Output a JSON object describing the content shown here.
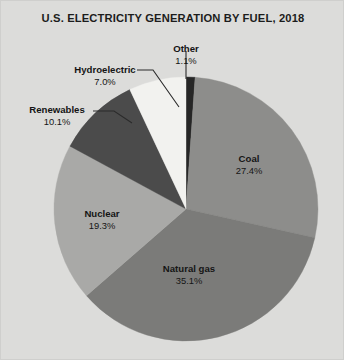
{
  "chart_data": {
    "type": "pie",
    "title": "U.S. ELECTRICITY GENERATION BY FUEL, 2018",
    "subtitle": "",
    "xlabel": "",
    "ylabel": "",
    "units": "percent",
    "legend_position": "none",
    "grid": false,
    "start_angle_deg": 0,
    "direction": "clockwise",
    "categories": [
      "Other",
      "Coal",
      "Natural gas",
      "Nuclear",
      "Renewables",
      "Hydroelectric"
    ],
    "values": [
      1.1,
      27.4,
      35.1,
      19.3,
      10.1,
      7.0
    ],
    "slices": [
      {
        "name": "Other",
        "value": 1.1,
        "pct_label": "1.1%",
        "color": "#262626",
        "label_placement": "outside",
        "leader_line": true
      },
      {
        "name": "Coal",
        "value": 27.4,
        "pct_label": "27.4%",
        "color": "#8d8d8b",
        "label_placement": "inside",
        "leader_line": false
      },
      {
        "name": "Natural gas",
        "value": 35.1,
        "pct_label": "35.1%",
        "color": "#7b7b79",
        "label_placement": "inside",
        "leader_line": false
      },
      {
        "name": "Nuclear",
        "value": 19.3,
        "pct_label": "19.3%",
        "color": "#a9a9a7",
        "label_placement": "inside",
        "leader_line": false
      },
      {
        "name": "Renewables",
        "value": 10.1,
        "pct_label": "10.1%",
        "color": "#4b4b4b",
        "label_placement": "outside",
        "leader_line": true
      },
      {
        "name": "Hydroelectric",
        "value": 7.0,
        "pct_label": "7.0%",
        "color": "#f2f2ef",
        "label_placement": "outside",
        "leader_line": true
      }
    ],
    "colors": {
      "background": "#dcdcda",
      "text": "#141414",
      "title": "#1c1c1c",
      "leader_line": "#2b2b2b"
    }
  }
}
